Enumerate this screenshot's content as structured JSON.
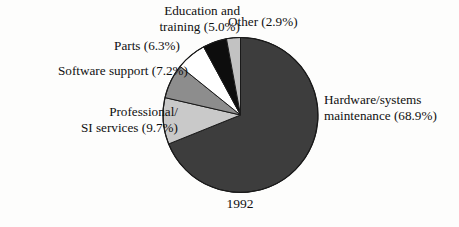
{
  "chart_data": {
    "type": "pie",
    "title": "",
    "caption": "1992",
    "xlabel": "",
    "ylabel": "",
    "legend_position": "callout-labels",
    "grid": false,
    "start_angle_deg": 0,
    "direction": "clockwise",
    "units": "percent",
    "total": 100.0,
    "categories": [
      "Hardware/systems maintenance",
      "Professional/SI services",
      "Software support",
      "Parts",
      "Education and training",
      "Other"
    ],
    "values": [
      68.9,
      9.7,
      7.2,
      6.3,
      5.0,
      2.9
    ],
    "slices": [
      {
        "name": "hardware-systems-maintenance",
        "label_line1": "Hardware/systems",
        "label_line2": "maintenance (68.9%)",
        "value": 68.9,
        "color": "#3d3d3d"
      },
      {
        "name": "professional-si-services",
        "label_line1": "Professional/",
        "label_line2": "SI services (9.7%)",
        "value": 9.7,
        "color": "#c9c9c9"
      },
      {
        "name": "software-support",
        "label_line1": "Software support (7.2%)",
        "label_line2": "",
        "value": 7.2,
        "color": "#8d8d8d"
      },
      {
        "name": "parts",
        "label_line1": "Parts (6.3%)",
        "label_line2": "",
        "value": 6.3,
        "color": "#ffffff"
      },
      {
        "name": "education-and-training",
        "label_line1": "Education and",
        "label_line2": "training (5.0%)",
        "value": 5.0,
        "color": "#0d0d0d"
      },
      {
        "name": "other",
        "label_line1": "Other (2.9%)",
        "label_line2": "",
        "value": 2.9,
        "color": "#c2c2c2"
      }
    ],
    "colors": {
      "hardware": "#3d3d3d",
      "professional": "#c9c9c9",
      "software": "#8d8d8d",
      "parts": "#ffffff",
      "education": "#0d0d0d",
      "other": "#c2c2c2",
      "outline": "#1a1a1a",
      "background": "#fdfdfc",
      "text": "#101010"
    }
  },
  "labels": {
    "education_line1": "Education and",
    "education_line2": "training (5.0%)",
    "other": "Other (2.9%)",
    "parts": "Parts (6.3%)",
    "software": "Software support (7.2%)",
    "professional_line1": "Professional/",
    "professional_line2": "SI services (9.7%)",
    "hardware_line1": "Hardware/systems",
    "hardware_line2": "maintenance (68.9%)",
    "caption": "1992"
  }
}
